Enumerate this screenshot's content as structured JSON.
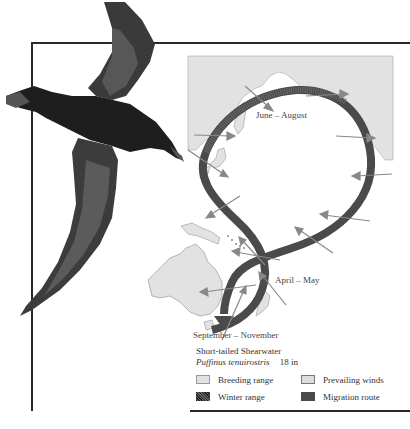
{
  "map": {
    "labels": {
      "summer": "June – August",
      "spring": "April – May",
      "autumn": "September – November"
    }
  },
  "legend": {
    "common_name": "Short-tailed Shearwater",
    "scientific_name": "Puffinus tenuirostris",
    "size": "18 in",
    "items": [
      {
        "label": "Breeding range",
        "icon": "breeding-range-swatch"
      },
      {
        "label": "Prevailing winds",
        "icon": "wind-arrow-swatch"
      },
      {
        "label": "Winter range",
        "icon": "winter-range-swatch"
      },
      {
        "label": "Migration route",
        "icon": "migration-route-swatch"
      }
    ]
  },
  "colors": {
    "land": "#e2e2e2",
    "route": "#4a4a4a",
    "wind_arrow": "#888888",
    "bird": "#1e1e1e",
    "frame": "#2a2a2a"
  }
}
